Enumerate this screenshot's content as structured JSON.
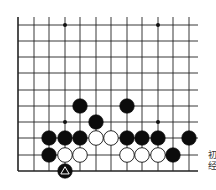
{
  "board": {
    "description": "Go problem diagram (lower edge of board)",
    "columns_x": [
      18,
      34,
      49,
      65,
      80,
      96,
      111,
      127,
      142,
      158,
      173,
      189
    ],
    "rows_y": [
      25,
      41,
      57,
      73,
      90,
      106,
      122,
      138,
      155,
      171
    ],
    "top_extent": 17,
    "right_extent": 198,
    "line_color": "#222222",
    "star_points": [
      [
        3,
        0
      ],
      [
        9,
        0
      ],
      [
        3,
        6
      ],
      [
        9,
        6
      ]
    ],
    "stones": [
      {
        "color": "black",
        "col": 4,
        "row": 5
      },
      {
        "color": "black",
        "col": 7,
        "row": 5
      },
      {
        "color": "black",
        "col": 5,
        "row": 6
      },
      {
        "color": "black",
        "col": 2,
        "row": 7
      },
      {
        "color": "black",
        "col": 3,
        "row": 7
      },
      {
        "color": "black",
        "col": 4,
        "row": 7
      },
      {
        "color": "white",
        "col": 5,
        "row": 7
      },
      {
        "color": "white",
        "col": 6,
        "row": 7
      },
      {
        "color": "black",
        "col": 7,
        "row": 7
      },
      {
        "color": "black",
        "col": 8,
        "row": 7
      },
      {
        "color": "black",
        "col": 9,
        "row": 7
      },
      {
        "color": "black",
        "col": 11,
        "row": 7
      },
      {
        "color": "black",
        "col": 2,
        "row": 8
      },
      {
        "color": "white",
        "col": 3,
        "row": 8
      },
      {
        "color": "white",
        "col": 4,
        "row": 8
      },
      {
        "color": "white",
        "col": 7,
        "row": 8
      },
      {
        "color": "white",
        "col": 8,
        "row": 8
      },
      {
        "color": "white",
        "col": 9,
        "row": 8
      },
      {
        "color": "black",
        "col": 10,
        "row": 8
      },
      {
        "color": "black",
        "col": 3,
        "row": 9,
        "marker": "triangle"
      }
    ]
  },
  "side_text": {
    "line1": "初",
    "line2": "经"
  }
}
